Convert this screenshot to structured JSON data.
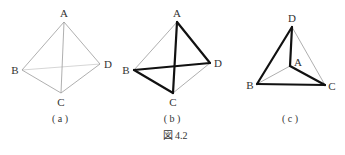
{
  "figure": {
    "caption": "図 4.2",
    "panels": [
      {
        "id": "a",
        "sublabel": "( a )",
        "vertices": {
          "A": {
            "x": 64,
            "y": 22,
            "label": "A"
          },
          "B": {
            "x": 22,
            "y": 70,
            "label": "B"
          },
          "C": {
            "x": 61,
            "y": 93,
            "label": "C"
          },
          "D": {
            "x": 100,
            "y": 64,
            "label": "D"
          }
        },
        "edges": [
          {
            "from": "A",
            "to": "B",
            "style": "thin"
          },
          {
            "from": "A",
            "to": "C",
            "style": "thin"
          },
          {
            "from": "A",
            "to": "D",
            "style": "thin"
          },
          {
            "from": "B",
            "to": "C",
            "style": "thin"
          },
          {
            "from": "C",
            "to": "D",
            "style": "thin"
          },
          {
            "from": "B",
            "to": "D",
            "style": "faint"
          }
        ]
      },
      {
        "id": "b",
        "sublabel": "( b )",
        "vertices": {
          "A": {
            "x": 177,
            "y": 22,
            "label": "A"
          },
          "B": {
            "x": 134,
            "y": 70,
            "label": "B"
          },
          "C": {
            "x": 173,
            "y": 93,
            "label": "C"
          },
          "D": {
            "x": 210,
            "y": 63,
            "label": "D"
          }
        },
        "edges": [
          {
            "from": "A",
            "to": "B",
            "style": "thin"
          },
          {
            "from": "C",
            "to": "D",
            "style": "thin"
          },
          {
            "from": "A",
            "to": "D",
            "style": "thick"
          },
          {
            "from": "D",
            "to": "B",
            "style": "thick"
          },
          {
            "from": "B",
            "to": "C",
            "style": "thick"
          },
          {
            "from": "C",
            "to": "A",
            "style": "thick"
          }
        ]
      },
      {
        "id": "c",
        "sublabel": "( c )",
        "vertices": {
          "A": {
            "x": 290,
            "y": 66,
            "label": "A"
          },
          "B": {
            "x": 257,
            "y": 84,
            "label": "B"
          },
          "C": {
            "x": 325,
            "y": 85,
            "label": "C"
          },
          "D": {
            "x": 292,
            "y": 27,
            "label": "D"
          }
        },
        "edges": [
          {
            "from": "D",
            "to": "C",
            "style": "thin"
          },
          {
            "from": "A",
            "to": "B",
            "style": "thin"
          },
          {
            "from": "D",
            "to": "A",
            "style": "thick"
          },
          {
            "from": "A",
            "to": "C",
            "style": "thick"
          },
          {
            "from": "C",
            "to": "B",
            "style": "thick"
          },
          {
            "from": "B",
            "to": "D",
            "style": "thick"
          }
        ]
      }
    ]
  }
}
